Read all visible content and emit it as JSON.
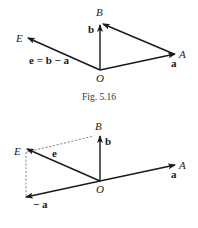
{
  "figure_top": {
    "caption": "Fig. 5.16",
    "points": {
      "O": "O",
      "A": "A",
      "B": "B",
      "E": "E"
    },
    "vectors": {
      "a": "a",
      "b": "b",
      "e_eq": "e = b − a"
    }
  },
  "figure_bottom": {
    "points": {
      "O": "O",
      "A": "A",
      "B": "B",
      "E": "E"
    },
    "vectors": {
      "a": "a",
      "b": "b",
      "e": "e",
      "neg_a": "− a"
    }
  },
  "colors": {
    "ink": "#1a1a1a",
    "dashed": "#555555",
    "background": "#ffffff"
  }
}
